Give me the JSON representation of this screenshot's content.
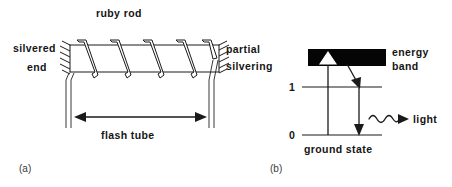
{
  "figure": {
    "background_color": "#ffffff",
    "ink_color": "#1a1a1a",
    "band_color": "#050505"
  },
  "panel_a": {
    "caption": "(a)",
    "title_label": "ruby rod",
    "left_end_label_line1": "silvered",
    "left_end_label_line2": "end",
    "right_end_label_line1": "partial",
    "right_end_label_line2": "silvering",
    "dimension_label": "flash tube",
    "coil_count": 5
  },
  "panel_b": {
    "caption": "(b)",
    "band_label_line1": "energy",
    "band_label_line2": "band",
    "level_1_label": "1",
    "level_0_label": "0",
    "ground_state_label": "ground state",
    "emission_label": "light"
  }
}
